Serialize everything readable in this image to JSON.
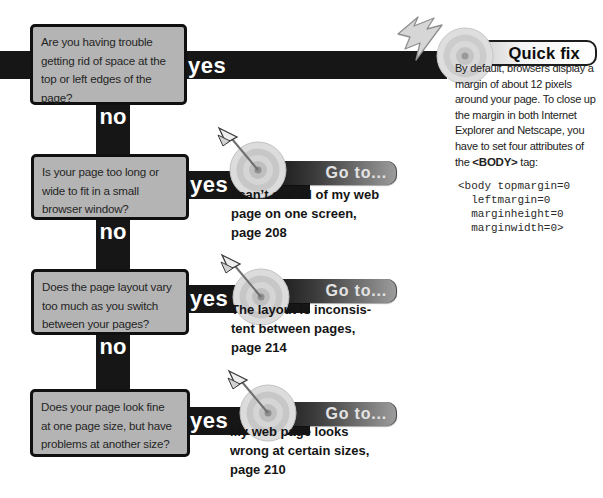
{
  "page": {
    "width": 603,
    "height": 498,
    "background": "#ffffff"
  },
  "colors": {
    "band_black": "#161616",
    "box_fill": "#b4b4b4",
    "box_border": "#101010",
    "label_white": "#ffffff",
    "goto_band_dark": "#060606",
    "goto_band_light": "#9d9d9d",
    "goto_header_text": "#e3e3e3",
    "quickfix_band_light": "#f4f4f4",
    "text_dark": "#1c1c1c"
  },
  "flowchart": {
    "yes_label": "yes",
    "no_label": "no",
    "questions": [
      {
        "text": "Are you having trouble\ngetting rid of space at the\ntop or left edges of the\npage?"
      },
      {
        "text": "Is your page too long or\nwide to fit in a small\nbrowser window?"
      },
      {
        "text": "Does the page layout vary\ntoo much as you switch\nbetween your pages?"
      },
      {
        "text": "Does your page look fine\nat one page size, but have\nproblems at another size?"
      }
    ],
    "gotos": [
      {
        "header": "Go to...",
        "text": "I can’t see all of my web\npage on one screen,\npage 208"
      },
      {
        "header": "Go to...",
        "text": "The layout is inconsis-\ntent between pages,\npage 214"
      },
      {
        "header": "Go to...",
        "text": "My web page looks\nwrong at certain sizes,\npage 210"
      }
    ]
  },
  "quick_fix": {
    "title": "Quick fix",
    "body_before": "By default, browsers display a\nmargin of about 12 pixels\naround your page. To close up\nthe margin in both Internet\nExplorer and Netscape, you\nhave to set four attributes of\nthe",
    "body_bold": "<BODY>",
    "body_after": "tag:",
    "code": "<body topmargin=0\n  leftmargin=0\n  marginheight=0\n  marginwidth=0>"
  },
  "icons": {
    "bullseye": "bullseye-target-icon",
    "dart": "dart-icon",
    "lightning": "lightning-bolt-icon"
  }
}
